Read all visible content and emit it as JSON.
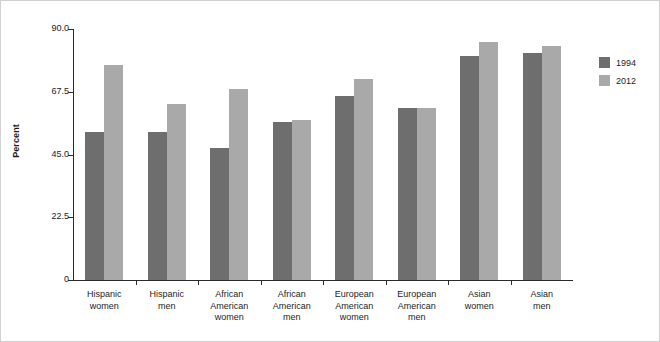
{
  "chart_data": {
    "type": "bar",
    "title": "",
    "subtitle": "",
    "xlabel": "",
    "ylabel": "Percent",
    "ylim": [
      0,
      90
    ],
    "yticks": [
      "0",
      "22.5",
      "45.0",
      "67.5",
      "90.0"
    ],
    "ytick_values": [
      0,
      22.5,
      45.0,
      67.5,
      90.0
    ],
    "grid": false,
    "legend_position": "right",
    "categories": [
      "Hispanic women",
      "Hispanic men",
      "African American women",
      "African American men",
      "European American women",
      "European American men",
      "Asian women",
      "Asian men"
    ],
    "category_lines": [
      [
        "Hispanic",
        "women"
      ],
      [
        "Hispanic",
        "men"
      ],
      [
        "African",
        "American",
        "women"
      ],
      [
        "African",
        "American",
        "men"
      ],
      [
        "European",
        "American",
        "women"
      ],
      [
        "European",
        "American",
        "men"
      ],
      [
        "Asian",
        "women"
      ],
      [
        "Asian",
        "men"
      ]
    ],
    "series": [
      {
        "name": "1994",
        "color": "#6e6e6e",
        "values": [
          53.0,
          53.0,
          47.5,
          56.5,
          66.0,
          61.5,
          80.5,
          81.5
        ]
      },
      {
        "name": "2012",
        "color": "#a9a9a9",
        "values": [
          77.0,
          63.0,
          68.5,
          57.5,
          72.0,
          61.5,
          85.5,
          84.0
        ]
      }
    ]
  },
  "legend": {
    "items": [
      {
        "label": "1994",
        "color": "#6e6e6e"
      },
      {
        "label": "2012",
        "color": "#a9a9a9"
      }
    ]
  },
  "axis": {
    "y_title": "Percent"
  }
}
